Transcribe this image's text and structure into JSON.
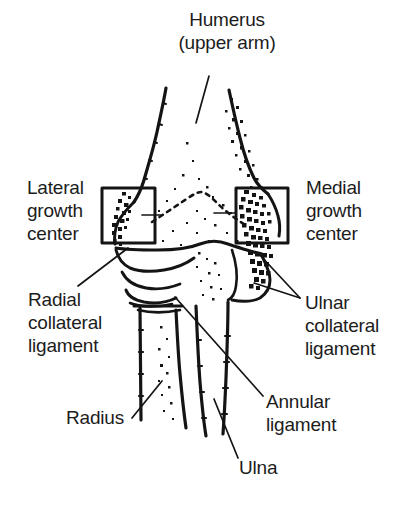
{
  "figure": {
    "background_color": "#ffffff",
    "ink_color": "#1c1c1c",
    "labels": {
      "humerus": "Humerus\n(upper arm)",
      "lateral_growth_center": "Lateral\ngrowth\ncenter",
      "medial_growth_center": "Medial\ngrowth\ncenter",
      "radial_collateral_ligament": "Radial\ncollateral\nligament",
      "ulnar_collateral_ligament": "Ulnar\ncollateral\nligament",
      "radius": "Radius",
      "annular_ligament": "Annular\nligament",
      "ulna": "Ulna"
    },
    "callout_boxes": [
      {
        "name": "lateral-growth-center-box",
        "x": 102,
        "y": 188,
        "width": 53,
        "height": 55
      },
      {
        "name": "medial-growth-center-box",
        "x": 236,
        "y": 188,
        "width": 52,
        "height": 55
      }
    ],
    "leader_lines": [
      {
        "name": "humerus-leader",
        "x1": 209,
        "y1": 76,
        "x2": 196,
        "y2": 123
      },
      {
        "name": "lateral-growth-center-leader",
        "x1": 142,
        "y1": 215,
        "x2": 163,
        "y2": 215
      },
      {
        "name": "medial-growth-center-leader",
        "x1": 236,
        "y1": 213,
        "x2": 214,
        "y2": 213
      },
      {
        "name": "radial-collateral-ligament-leader",
        "x1": 78,
        "y1": 286,
        "x2": 128,
        "y2": 248
      },
      {
        "name": "ulnar-collateral-ligament-leader-upper",
        "x1": 300,
        "y1": 298,
        "x2": 258,
        "y2": 253
      },
      {
        "name": "ulnar-collateral-ligament-leader-lower",
        "x1": 300,
        "y1": 298,
        "x2": 254,
        "y2": 283
      },
      {
        "name": "annular-ligament-leader",
        "x1": 263,
        "y1": 396,
        "x2": 175,
        "y2": 297
      },
      {
        "name": "radius-leader",
        "x1": 132,
        "y1": 418,
        "x2": 162,
        "y2": 381
      },
      {
        "name": "ulna-leader",
        "x1": 238,
        "y1": 458,
        "x2": 214,
        "y2": 399
      }
    ]
  }
}
